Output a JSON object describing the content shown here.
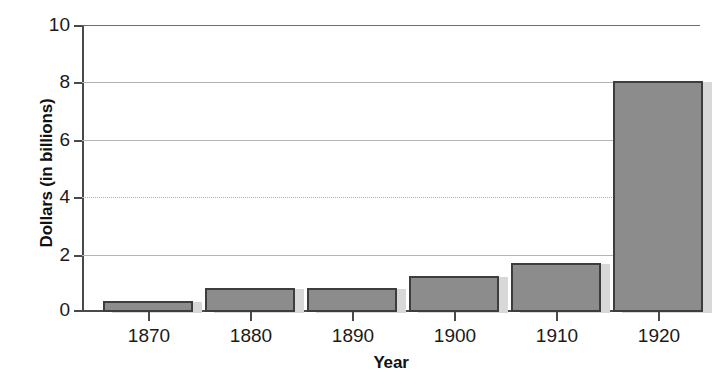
{
  "chart_data": {
    "type": "bar",
    "title": "",
    "xlabel": "Year",
    "ylabel": "Dollars (in billions)",
    "categories": [
      "1870",
      "1880",
      "1890",
      "1900",
      "1910",
      "1920"
    ],
    "values": [
      0.4,
      0.85,
      0.85,
      1.25,
      1.7,
      8.05
    ],
    "ylim": [
      0,
      10
    ],
    "yticks": [
      0,
      2,
      4,
      6,
      8,
      10
    ],
    "ytick_labels": [
      "0",
      "2",
      "4",
      "6",
      "8",
      "10"
    ],
    "grid": true,
    "grid_axis": "y",
    "legend": false,
    "series": [
      {
        "name": "Dollars (in billions)",
        "values": [
          0.4,
          0.85,
          0.85,
          1.25,
          1.7,
          8.05
        ]
      }
    ],
    "colors": {
      "bar_fill": "#8c8c8c",
      "bar_border": "#3d3d3d",
      "bar_shadow": "#d8d8d8",
      "axis": "#4a4a4a",
      "gridline": "#b4b4b4",
      "background": "#ffffff",
      "text": "#1a1a1a"
    }
  }
}
